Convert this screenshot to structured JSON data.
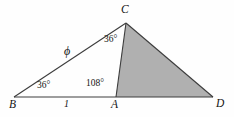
{
  "figure": {
    "type": "geometry-diagram",
    "width": 234,
    "height": 117,
    "background_color": "#fefefe",
    "stroke_color": "#3c3c3c",
    "shade_color": "#b0b0b0",
    "text_color": "#141414",
    "vertices": [
      {
        "name": "B",
        "label": "B",
        "x": 14,
        "y": 97
      },
      {
        "name": "A",
        "label": "A",
        "x": 116,
        "y": 97
      },
      {
        "name": "D",
        "label": "D",
        "x": 213,
        "y": 97
      },
      {
        "name": "C",
        "label": "C",
        "x": 126,
        "y": 23
      }
    ],
    "segments": [
      {
        "name": "base-BD",
        "from": "B",
        "to": "D"
      },
      {
        "name": "side-BC",
        "from": "B",
        "to": "C"
      },
      {
        "name": "cevian-AC",
        "from": "A",
        "to": "C"
      },
      {
        "name": "side-CD",
        "from": "C",
        "to": "D"
      }
    ],
    "shaded_region": {
      "name": "triangle-ACD",
      "points": "116,97 126,23 213,97",
      "fill": "#b0b0b0"
    },
    "angle_labels": [
      {
        "name": "angle-at-B",
        "value": "36",
        "unit": "°",
        "text": "36°"
      },
      {
        "name": "angle-at-A",
        "value": "108",
        "unit": "°",
        "text": "108°"
      },
      {
        "name": "angle-at-C",
        "value": "36",
        "unit": "°",
        "text": "36°"
      }
    ],
    "side_labels": [
      {
        "name": "side-BA-length",
        "text": "1"
      },
      {
        "name": "side-BC-length",
        "text": "ϕ"
      }
    ]
  }
}
